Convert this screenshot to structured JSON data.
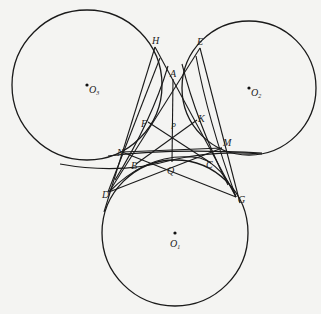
{
  "figure": {
    "type": "geometry-diagram",
    "circles": [
      {
        "id": "O3",
        "label": "O",
        "sub": "3",
        "cx": 87,
        "cy": 85,
        "r": 75
      },
      {
        "id": "O2",
        "label": "O",
        "sub": "2",
        "cx": 249,
        "cy": 88,
        "r": 67
      },
      {
        "id": "O1",
        "label": "O",
        "sub": "1",
        "cx": 175,
        "cy": 233,
        "r": 73
      }
    ],
    "points": {
      "H": {
        "label": "H",
        "x": 155,
        "y": 47
      },
      "E": {
        "label": "E",
        "x": 200,
        "y": 48
      },
      "A": {
        "label": "A",
        "x": 173,
        "y": 79
      },
      "F": {
        "label": "F",
        "x": 148,
        "y": 122
      },
      "K": {
        "label": "K",
        "x": 197,
        "y": 120
      },
      "P": {
        "label": "P",
        "x": 172,
        "y": 132
      },
      "N": {
        "label": "N",
        "x": 122,
        "y": 152
      },
      "M": {
        "label": "M",
        "x": 222,
        "y": 148
      },
      "B": {
        "label": "B",
        "x": 136,
        "y": 164
      },
      "C": {
        "label": "C",
        "x": 211,
        "y": 163
      },
      "Q": {
        "label": "Q",
        "x": 172,
        "y": 162
      },
      "D": {
        "label": "D",
        "x": 109,
        "y": 192
      },
      "G": {
        "label": "G",
        "x": 236,
        "y": 197
      }
    },
    "labels": {
      "H": "H",
      "E": "E",
      "A": "A",
      "F": "F",
      "K": "K",
      "P": "P",
      "N": "N",
      "M": "M",
      "B": "B",
      "C": "C",
      "Q": "Q",
      "D": "D",
      "G": "G",
      "O": "O",
      "sub1": "1",
      "sub2": "2",
      "sub3": "3"
    }
  }
}
